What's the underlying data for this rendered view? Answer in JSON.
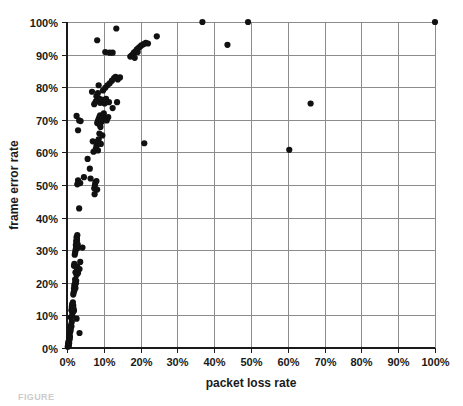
{
  "figure": {
    "partial_caption": "FIGURE"
  },
  "chart_data": {
    "type": "scatter",
    "title": "",
    "xlabel": "packet loss rate",
    "ylabel": "frame error rate",
    "xlim": [
      0,
      100
    ],
    "ylim": [
      0,
      100
    ],
    "grid": true,
    "legend": false,
    "legend_position": "none",
    "x_tick_labels": [
      "0%",
      "10%",
      "20%",
      "30%",
      "40%",
      "50%",
      "60%",
      "70%",
      "80%",
      "90%",
      "100%"
    ],
    "x_tick_values": [
      0,
      10,
      20,
      30,
      40,
      50,
      60,
      70,
      80,
      90,
      100
    ],
    "y_tick_labels": [
      "0%",
      "10%",
      "20%",
      "30%",
      "40%",
      "50%",
      "60%",
      "70%",
      "80%",
      "90%",
      "100%"
    ],
    "y_tick_values": [
      0,
      10,
      20,
      30,
      40,
      50,
      60,
      70,
      80,
      90,
      100
    ],
    "marker": "circle",
    "marker_color": "#111111",
    "marker_size": 3.1,
    "point_count": 163,
    "points": [
      [
        0.2,
        0.4
      ],
      [
        0.3,
        0.8
      ],
      [
        0.3,
        1.3
      ],
      [
        0.4,
        1.0
      ],
      [
        0.4,
        1.8
      ],
      [
        0.5,
        0.6
      ],
      [
        0.5,
        2.2
      ],
      [
        0.6,
        1.5
      ],
      [
        0.6,
        3.0
      ],
      [
        0.7,
        2.6
      ],
      [
        0.7,
        4.0
      ],
      [
        0.8,
        3.4
      ],
      [
        0.9,
        5.0
      ],
      [
        0.9,
        6.3
      ],
      [
        1.0,
        5.6
      ],
      [
        1.1,
        7.0
      ],
      [
        1.2,
        6.6
      ],
      [
        1.3,
        8.0
      ],
      [
        1.0,
        9.4
      ],
      [
        1.4,
        9.9
      ],
      [
        1.5,
        11.0
      ],
      [
        1.2,
        11.6
      ],
      [
        1.6,
        12.2
      ],
      [
        1.3,
        12.6
      ],
      [
        1.7,
        13.0
      ],
      [
        1.4,
        13.4
      ],
      [
        1.8,
        12.0
      ],
      [
        1.5,
        10.8
      ],
      [
        1.9,
        11.4
      ],
      [
        1.6,
        14.0
      ],
      [
        3.4,
        4.6
      ],
      [
        2.6,
        9.0
      ],
      [
        1.7,
        16.4
      ],
      [
        1.8,
        17.0
      ],
      [
        2.0,
        17.6
      ],
      [
        1.9,
        18.2
      ],
      [
        2.1,
        18.8
      ],
      [
        2.0,
        19.4
      ],
      [
        2.2,
        20.0
      ],
      [
        2.1,
        19.0
      ],
      [
        2.3,
        18.4
      ],
      [
        2.4,
        19.8
      ],
      [
        2.5,
        20.6
      ],
      [
        2.2,
        21.0
      ],
      [
        2.6,
        22.4
      ],
      [
        2.3,
        23.2
      ],
      [
        1.9,
        25.2
      ],
      [
        2.0,
        25.8
      ],
      [
        2.7,
        24.4
      ],
      [
        2.8,
        25.0
      ],
      [
        3.4,
        24.2
      ],
      [
        3.6,
        26.4
      ],
      [
        3.0,
        23.0
      ],
      [
        2.1,
        28.6
      ],
      [
        2.2,
        29.2
      ],
      [
        2.3,
        29.8
      ],
      [
        2.4,
        30.4
      ],
      [
        2.5,
        31.0
      ],
      [
        2.4,
        31.6
      ],
      [
        2.6,
        32.2
      ],
      [
        2.5,
        32.8
      ],
      [
        2.7,
        33.4
      ],
      [
        2.6,
        34.0
      ],
      [
        2.8,
        34.6
      ],
      [
        2.7,
        33.0
      ],
      [
        2.9,
        31.8
      ],
      [
        2.8,
        30.6
      ],
      [
        4.2,
        30.8
      ],
      [
        3.3,
        42.8
      ],
      [
        2.8,
        50.2
      ],
      [
        3.0,
        51.4
      ],
      [
        3.6,
        50.6
      ],
      [
        4.6,
        52.4
      ],
      [
        6.4,
        52.0
      ],
      [
        6.2,
        55.0
      ],
      [
        7.4,
        49.0
      ],
      [
        7.6,
        50.0
      ],
      [
        7.7,
        50.8
      ],
      [
        7.5,
        47.2
      ],
      [
        8.2,
        48.6
      ],
      [
        8.0,
        51.2
      ],
      [
        5.6,
        58.0
      ],
      [
        7.2,
        60.2
      ],
      [
        7.8,
        61.0
      ],
      [
        8.0,
        62.0
      ],
      [
        8.2,
        63.2
      ],
      [
        7.0,
        63.4
      ],
      [
        8.4,
        60.6
      ],
      [
        8.6,
        64.0
      ],
      [
        9.2,
        62.6
      ],
      [
        9.6,
        65.2
      ],
      [
        8.8,
        65.8
      ],
      [
        3.0,
        66.8
      ],
      [
        2.6,
        71.2
      ],
      [
        3.3,
        69.8
      ],
      [
        3.7,
        69.6
      ],
      [
        8.2,
        69.0
      ],
      [
        8.4,
        69.6
      ],
      [
        8.6,
        70.2
      ],
      [
        8.8,
        70.8
      ],
      [
        9.0,
        71.4
      ],
      [
        9.2,
        70.0
      ],
      [
        9.4,
        69.4
      ],
      [
        9.6,
        70.6
      ],
      [
        9.8,
        71.2
      ],
      [
        8.9,
        68.4
      ],
      [
        9.1,
        67.8
      ],
      [
        10.0,
        72.0
      ],
      [
        10.4,
        70.4
      ],
      [
        10.8,
        69.8
      ],
      [
        11.2,
        70.8
      ],
      [
        7.4,
        74.8
      ],
      [
        7.8,
        75.6
      ],
      [
        8.2,
        76.0
      ],
      [
        8.6,
        76.6
      ],
      [
        9.0,
        75.2
      ],
      [
        9.4,
        76.2
      ],
      [
        8.0,
        77.2
      ],
      [
        8.4,
        78.2
      ],
      [
        6.8,
        78.6
      ],
      [
        10.2,
        75.0
      ],
      [
        10.6,
        76.4
      ],
      [
        11.4,
        75.4
      ],
      [
        12.4,
        73.6
      ],
      [
        13.6,
        75.4
      ],
      [
        8.6,
        80.6
      ],
      [
        9.8,
        79.0
      ],
      [
        10.4,
        79.8
      ],
      [
        11.0,
        80.6
      ],
      [
        11.6,
        81.2
      ],
      [
        12.2,
        82.0
      ],
      [
        12.8,
        82.8
      ],
      [
        13.2,
        83.2
      ],
      [
        13.8,
        82.4
      ],
      [
        14.4,
        83.0
      ],
      [
        8.2,
        94.4
      ],
      [
        10.4,
        90.8
      ],
      [
        11.6,
        90.6
      ],
      [
        12.4,
        90.6
      ],
      [
        13.4,
        98.0
      ],
      [
        17.2,
        89.4
      ],
      [
        17.6,
        89.8
      ],
      [
        18.0,
        90.2
      ],
      [
        18.2,
        90.6
      ],
      [
        18.6,
        91.0
      ],
      [
        19.0,
        91.6
      ],
      [
        19.4,
        92.0
      ],
      [
        19.8,
        92.4
      ],
      [
        20.2,
        92.8
      ],
      [
        20.8,
        93.2
      ],
      [
        21.4,
        93.6
      ],
      [
        22.0,
        93.4
      ],
      [
        18.4,
        89.0
      ],
      [
        19.2,
        90.8
      ],
      [
        24.4,
        95.6
      ],
      [
        21.0,
        62.8
      ],
      [
        36.8,
        100.0
      ],
      [
        43.6,
        93.0
      ],
      [
        49.2,
        100.0
      ],
      [
        60.4,
        60.8
      ],
      [
        66.2,
        75.0
      ],
      [
        100.0,
        100.0
      ]
    ]
  }
}
